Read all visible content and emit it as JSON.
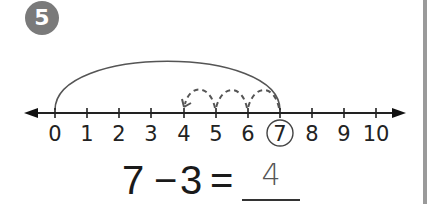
{
  "problem": {
    "number": "5",
    "badge_color": "#7a7a7a"
  },
  "number_line": {
    "min": 0,
    "max": 10,
    "tick_labels": [
      "0",
      "1",
      "2",
      "3",
      "4",
      "5",
      "6",
      "7",
      "8",
      "9",
      "10"
    ],
    "circled_value": "7",
    "solid_jump": {
      "from": 0,
      "to": 7
    },
    "dashed_jumps": [
      {
        "from": 7,
        "to": 6
      },
      {
        "from": 6,
        "to": 5
      },
      {
        "from": 5,
        "to": 4
      }
    ]
  },
  "equation": {
    "minuend": "7",
    "operator": "−",
    "subtrahend": "3",
    "equals": "=",
    "answer": "4"
  }
}
